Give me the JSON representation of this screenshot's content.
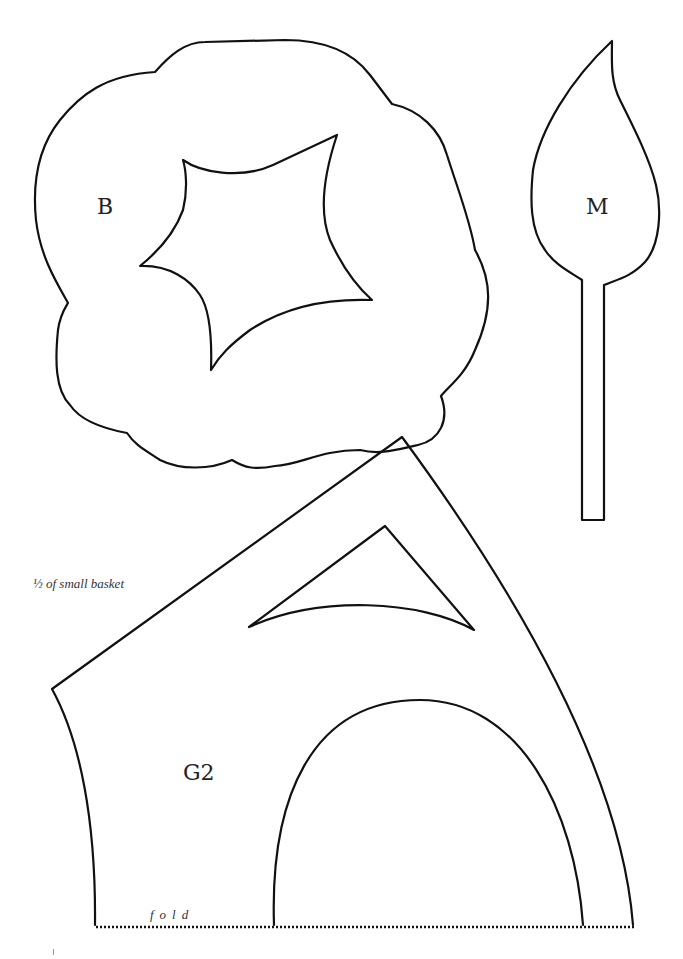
{
  "document": {
    "type": "craft pattern template",
    "pieces": [
      {
        "id": "B",
        "label": "B",
        "shape": "cloud-shaped flower with four-pointed star cutout"
      },
      {
        "id": "M",
        "label": "M",
        "shape": "leaf with long stem"
      },
      {
        "id": "G2",
        "label": "G2",
        "shape": "half basket with triangular cutout and arched cutout"
      }
    ],
    "caption": "½ of small basket",
    "fold_label": "fold",
    "colors": {
      "line": "#111111",
      "background": "#ffffff"
    }
  }
}
